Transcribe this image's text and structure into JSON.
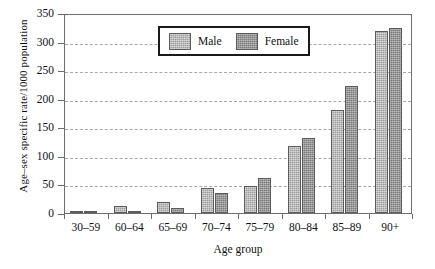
{
  "chart_data": {
    "type": "bar",
    "title": "",
    "xlabel": "Age group",
    "ylabel": "Age–sex specific rate/1000 population",
    "categories": [
      "30–59",
      "60–64",
      "65–69",
      "70–74",
      "75–79",
      "80–84",
      "85–89",
      "90+"
    ],
    "series": [
      {
        "name": "Male",
        "values": [
          1,
          13,
          19,
          44,
          47,
          118,
          181,
          320
        ]
      },
      {
        "name": "Female",
        "values": [
          1,
          3,
          8,
          35,
          62,
          132,
          224,
          325
        ]
      }
    ],
    "ylim": [
      0,
      350
    ],
    "yticks": [
      0,
      50,
      100,
      150,
      200,
      250,
      300,
      350
    ],
    "ytick_labels": [
      "0",
      "50",
      "100",
      "150",
      "200",
      "250",
      "300",
      "350"
    ],
    "grid": "horizontal-dashed",
    "legend_position": "top-center",
    "colors": {
      "male": "#9d9d9d",
      "female": "#7b7b7b",
      "axis": "#6e6e6e",
      "grid": "#a9a9a9",
      "text": "#111111",
      "background": "#ffffff"
    }
  },
  "legend": {
    "entries": [
      {
        "label": "Male"
      },
      {
        "label": "Female"
      }
    ]
  }
}
